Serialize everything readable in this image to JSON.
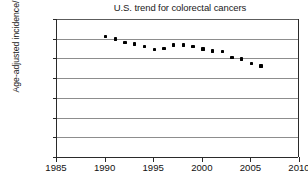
{
  "chart_data": {
    "type": "scatter",
    "title": "U.S. trend for colorectal cancers",
    "xlabel": "",
    "ylabel": "Age-adjusted incidence/100,000",
    "xlim": [
      1985,
      2010
    ],
    "ylim": [
      0,
      70
    ],
    "xticks": [
      1985,
      1990,
      1995,
      2000,
      2005,
      2010
    ],
    "yticks": [
      0,
      10,
      20,
      30,
      40,
      50,
      60,
      70
    ],
    "grid": true,
    "legend": null,
    "marker": "filled-square",
    "marker_color": "#000000",
    "x": [
      1990,
      1991,
      1992,
      1993,
      1994,
      1995,
      1996,
      1997,
      1998,
      1999,
      2000,
      2001,
      2002,
      2003,
      2004,
      2005,
      2006
    ],
    "values": [
      61.0,
      59.8,
      58.2,
      57.4,
      56.2,
      54.6,
      55.0,
      56.8,
      56.9,
      56.0,
      54.8,
      53.8,
      53.5,
      50.6,
      49.8,
      47.4,
      46.2
    ]
  },
  "axis": {
    "y_tick_labels": [
      "70",
      "60",
      "50",
      "40",
      "30",
      "20",
      "10",
      "0"
    ],
    "x_tick_labels": [
      "1985",
      "1990",
      "1995",
      "2000",
      "2005",
      "2010"
    ]
  }
}
